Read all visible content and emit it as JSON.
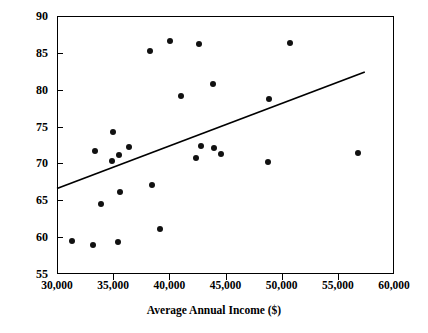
{
  "chart_data": {
    "type": "scatter",
    "title": "",
    "xlabel": "Average Annual Income ($)",
    "ylabel": "High School Graduation Rates (%)",
    "xlim": [
      30000,
      60000
    ],
    "ylim": [
      55,
      90
    ],
    "grid": false,
    "legend": null,
    "x_ticks": [
      30000,
      35000,
      40000,
      45000,
      50000,
      55000,
      60000
    ],
    "x_tick_labels": [
      "30,000",
      "35,000",
      "40,000",
      "45,000",
      "50,000",
      "55,000",
      "60,000"
    ],
    "y_ticks": [
      55,
      60,
      65,
      70,
      75,
      80,
      85,
      90
    ],
    "y_tick_labels": [
      "55",
      "60",
      "65",
      "70",
      "75",
      "80",
      "85",
      "90"
    ],
    "series": [
      {
        "name": "districts",
        "marker": "filled-circle",
        "color": "#111111",
        "points": [
          [
            31300,
            59.5
          ],
          [
            33200,
            58.9
          ],
          [
            33400,
            71.7
          ],
          [
            33900,
            64.5
          ],
          [
            34900,
            70.3
          ],
          [
            35000,
            74.2
          ],
          [
            35400,
            59.3
          ],
          [
            35500,
            71.2
          ],
          [
            35600,
            66.1
          ],
          [
            36400,
            72.2
          ],
          [
            38300,
            85.3
          ],
          [
            38500,
            67.1
          ],
          [
            39200,
            61.1
          ],
          [
            40100,
            86.6
          ],
          [
            41000,
            79.2
          ],
          [
            42400,
            70.7
          ],
          [
            42600,
            86.2
          ],
          [
            42800,
            72.4
          ],
          [
            43900,
            80.8
          ],
          [
            44000,
            72.1
          ],
          [
            44600,
            71.3
          ],
          [
            48800,
            70.2
          ],
          [
            48900,
            78.8
          ],
          [
            50700,
            86.4
          ],
          [
            56800,
            71.4
          ]
        ]
      }
    ],
    "trend_line": {
      "name": "least-squares regression line",
      "color": "#000000",
      "x_start": 30000,
      "y_start": 66.6,
      "x_end": 57400,
      "y_end": 82.4
    }
  }
}
